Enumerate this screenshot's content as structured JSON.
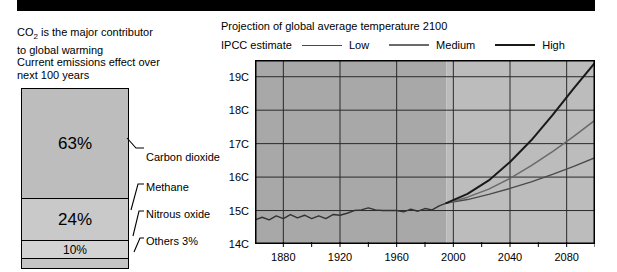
{
  "banner": {
    "label": "top-black-banner"
  },
  "left": {
    "caption_1_pre": "CO",
    "caption_1_sub": "2",
    "caption_1_post": " is the major contributor\nto global warming",
    "caption_2": "Current emissions effect over\nnext 100 years",
    "segments": [
      {
        "name": "carbon-dioxide",
        "value_label": "63%",
        "percent": 63,
        "callout": "Carbon dioxide",
        "color": "#bdbdbd"
      },
      {
        "name": "methane",
        "value_label": "24%",
        "percent": 24,
        "callout": "Methane",
        "color": "#c9c9c9"
      },
      {
        "name": "nitrous-oxide",
        "value_label": "10%",
        "percent": 10,
        "callout": "Nitrous oxide",
        "color": "#d3d3d3"
      },
      {
        "name": "others",
        "value_label": "",
        "percent": 3,
        "callout": "Others 3%",
        "color": "#c4c4c4"
      }
    ]
  },
  "right": {
    "title": "Projection of global average temperature 2100",
    "legend_title": "IPCC estimate",
    "legend": [
      {
        "label": "Low",
        "color": "#4a4a4a",
        "width": 1
      },
      {
        "label": "Medium",
        "color": "#6a6a6a",
        "width": 1.5
      },
      {
        "label": "High",
        "color": "#1a1a1a",
        "width": 2
      }
    ]
  },
  "chart_data": {
    "type": "line",
    "title": "Projection of global average temperature 2100",
    "xlabel": "",
    "ylabel": "",
    "xlim": [
      1860,
      2100
    ],
    "ylim": [
      14,
      19.5
    ],
    "grid": true,
    "legend_position": "top",
    "yticks": [
      14,
      15,
      16,
      17,
      18,
      19
    ],
    "ytick_labels": [
      "14C",
      "15C",
      "16C",
      "17C",
      "18C",
      "19C"
    ],
    "xticks": [
      1880,
      1920,
      1960,
      2000,
      2040,
      2080
    ],
    "xtick_labels": [
      "1880",
      "1920",
      "1960",
      "2000",
      "2040",
      "2080"
    ],
    "xminor_ticks": [
      1900,
      1940,
      1980,
      2020,
      2060,
      2100
    ],
    "shaded_bands": [
      {
        "name": "historical",
        "from": 1860,
        "to": 1995,
        "color": "#a8a8a8"
      },
      {
        "name": "projection",
        "from": 1995,
        "to": 2100,
        "color": "#bcbcbc"
      }
    ],
    "series": [
      {
        "name": "Observed",
        "color": "#333333",
        "x": [
          1860,
          1865,
          1870,
          1875,
          1880,
          1885,
          1890,
          1895,
          1900,
          1905,
          1910,
          1915,
          1920,
          1925,
          1930,
          1935,
          1940,
          1945,
          1950,
          1955,
          1960,
          1965,
          1970,
          1975,
          1980,
          1985,
          1990,
          1995
        ],
        "values": [
          14.72,
          14.8,
          14.72,
          14.84,
          14.76,
          14.88,
          14.78,
          14.86,
          14.76,
          14.84,
          14.76,
          14.88,
          14.86,
          14.92,
          15.0,
          15.02,
          15.08,
          15.02,
          15.0,
          15.0,
          15.0,
          14.96,
          15.04,
          14.98,
          15.06,
          15.02,
          15.14,
          15.22
        ]
      },
      {
        "name": "Low",
        "color": "#4a4a4a",
        "x": [
          1995,
          2010,
          2025,
          2040,
          2055,
          2070,
          2085,
          2100
        ],
        "values": [
          15.22,
          15.33,
          15.48,
          15.66,
          15.86,
          16.08,
          16.32,
          16.58
        ]
      },
      {
        "name": "Medium",
        "color": "#6a6a6a",
        "x": [
          1995,
          2010,
          2025,
          2040,
          2055,
          2070,
          2085,
          2100
        ],
        "values": [
          15.22,
          15.4,
          15.64,
          15.96,
          16.34,
          16.76,
          17.22,
          17.7
        ]
      },
      {
        "name": "High",
        "color": "#1a1a1a",
        "x": [
          1995,
          2010,
          2025,
          2040,
          2055,
          2070,
          2085,
          2100
        ],
        "values": [
          15.22,
          15.5,
          15.9,
          16.45,
          17.1,
          17.85,
          18.65,
          19.42
        ]
      }
    ]
  }
}
